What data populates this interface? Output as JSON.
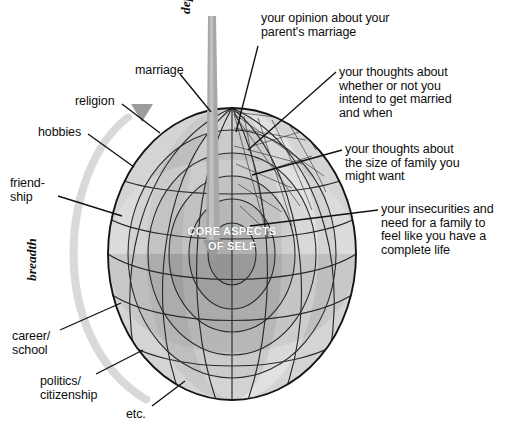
{
  "figure": {
    "type": "diagram",
    "core_label": "CORE ASPECTS\nOF SELF",
    "axes": [
      {
        "name": "depth",
        "label": "depth",
        "orientation": "vertical",
        "arrow": "down"
      },
      {
        "name": "breadth",
        "label": "breadth",
        "orientation": "vertical-arc",
        "arrow": "none"
      }
    ],
    "colors": {
      "background": "#ffffff",
      "outline": "#1a1a1a",
      "layer_1_outer": "#d2d2d2",
      "layer_2": "#c0c0c0",
      "layer_3": "#ababab",
      "layer_4": "#9a9a9a",
      "layer_5_core": "#8a8a8a",
      "wedge_light": "#dcdcdc",
      "wedge_dark": "#8f8f8f",
      "breadth_arc": "#d8d8d8",
      "depth_arrow": "#a6a6a6",
      "triangle_marker": "#9a9a9a",
      "leader_line": "#111111",
      "core_text": "#ffffff"
    },
    "left_labels": [
      {
        "id": "marriage",
        "text": "marriage"
      },
      {
        "id": "religion",
        "text": "religion"
      },
      {
        "id": "hobbies",
        "text": "hobbies"
      },
      {
        "id": "friendship",
        "text": "friend-\nship"
      },
      {
        "id": "career",
        "text": "career/\nschool"
      },
      {
        "id": "politics",
        "text": "politics/\ncitizenship"
      },
      {
        "id": "etc",
        "text": "etc."
      }
    ],
    "right_labels": [
      {
        "id": "parents_marriage",
        "text": "your opinion about your\nparent's marriage"
      },
      {
        "id": "intend_married",
        "text": "your thoughts about\nwhether or not you\nintend to get married\nand when"
      },
      {
        "id": "family_size",
        "text": "your thoughts about\nthe size of family you\nmight want"
      },
      {
        "id": "insecurities",
        "text": "your insecurities and\nneed for a family to\nfeel like you have a\ncomplete life"
      }
    ],
    "markers": [
      {
        "id": "triangle-marker",
        "shape": "triangle-down"
      }
    ]
  }
}
